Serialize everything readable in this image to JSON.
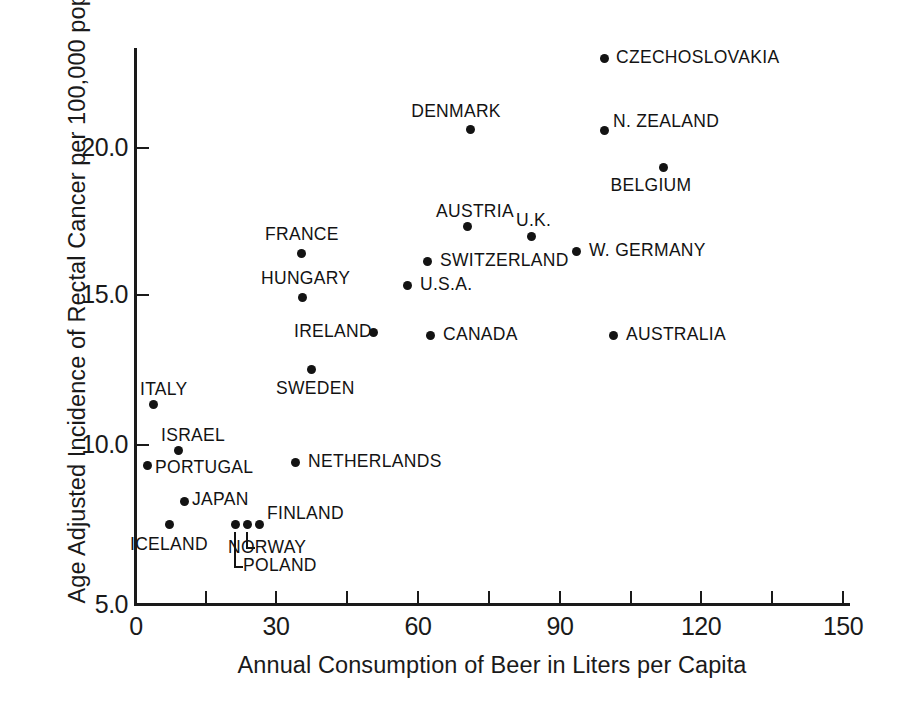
{
  "chart_data": {
    "type": "scatter",
    "title": "",
    "xlabel": "Annual Consumption of Beer in Liters per Capita",
    "ylabel": "Age Adjusted Incidence of Rectal Cancer per 100,000 pop.",
    "xlim": [
      0,
      160
    ],
    "ylim": [
      5.0,
      23.5
    ],
    "grid": false,
    "legend": "none",
    "xticks": [
      0,
      30,
      60,
      90,
      120,
      150
    ],
    "xtick_labels": [
      "0",
      "30",
      "60",
      "90",
      "120",
      "150"
    ],
    "xminor_ticks": [
      15,
      45,
      75,
      105,
      135
    ],
    "yticks": [
      5.0,
      10.0,
      15.0,
      20.0
    ],
    "ytick_labels": [
      "5.0",
      "10.0",
      "15.0",
      "20.0"
    ],
    "point_color": "#131313",
    "axis_color": "#1a1a1a",
    "points": [
      {
        "name": "CZECHOSLOVAKIA",
        "x": 100.5,
        "y": 23.0,
        "px": 604,
        "py": 58,
        "label_x": 616,
        "label_y": 49,
        "anchor": "left"
      },
      {
        "name": "DENMARK",
        "x": 71.8,
        "y": 20.6,
        "px": 470,
        "py": 129,
        "label_x": 456,
        "label_y": 103,
        "anchor": "center"
      },
      {
        "name": "N. ZEALAND",
        "x": 100.5,
        "y": 20.5,
        "px": 604,
        "py": 130,
        "label_x": 613,
        "label_y": 113,
        "anchor": "left"
      },
      {
        "name": "BELGIUM",
        "x": 113.1,
        "y": 19.3,
        "px": 663,
        "py": 167,
        "label_x": 651,
        "label_y": 177,
        "anchor": "center"
      },
      {
        "name": "AUSTRIA",
        "x": 71.1,
        "y": 17.4,
        "px": 467,
        "py": 226,
        "label_x": 436,
        "label_y": 203,
        "anchor": "left"
      },
      {
        "name": "U.K.",
        "x": 84.9,
        "y": 17.0,
        "px": 531,
        "py": 236,
        "label_x": 516,
        "label_y": 212,
        "anchor": "left"
      },
      {
        "name": "SWITZERLAND",
        "x": 62.6,
        "y": 16.3,
        "px": 427,
        "py": 261,
        "label_x": 440,
        "label_y": 252,
        "anchor": "left"
      },
      {
        "name": "W. GERMANY",
        "x": 94.5,
        "y": 16.6,
        "px": 576,
        "py": 251,
        "label_x": 589,
        "label_y": 242,
        "anchor": "left"
      },
      {
        "name": "FRANCE",
        "x": 35.6,
        "y": 16.6,
        "px": 301,
        "py": 253,
        "label_x": 265,
        "label_y": 226,
        "anchor": "left"
      },
      {
        "name": "U.S.A.",
        "x": 58.3,
        "y": 15.5,
        "px": 407,
        "py": 285,
        "label_x": 420,
        "label_y": 276,
        "anchor": "left"
      },
      {
        "name": "HUNGARY",
        "x": 35.8,
        "y": 15.0,
        "px": 302,
        "py": 297,
        "label_x": 261,
        "label_y": 270,
        "anchor": "left"
      },
      {
        "name": "IRELAND",
        "x": 51.0,
        "y": 13.8,
        "px": 373,
        "py": 332,
        "label_x": 294,
        "label_y": 323,
        "anchor": "left"
      },
      {
        "name": "CANADA",
        "x": 63.2,
        "y": 13.7,
        "px": 430,
        "py": 335,
        "label_x": 443,
        "label_y": 326,
        "anchor": "left"
      },
      {
        "name": "AUSTRALIA",
        "x": 102.4,
        "y": 13.7,
        "px": 613,
        "py": 335,
        "label_x": 626,
        "label_y": 326,
        "anchor": "left"
      },
      {
        "name": "SWEDEN",
        "x": 37.7,
        "y": 12.7,
        "px": 311,
        "py": 369,
        "label_x": 276,
        "label_y": 380,
        "anchor": "left"
      },
      {
        "name": "ITALY",
        "x": 3.9,
        "y": 11.4,
        "px": 153,
        "py": 404,
        "label_x": 140,
        "label_y": 381,
        "anchor": "left"
      },
      {
        "name": "ISRAEL",
        "x": 9.2,
        "y": 9.9,
        "px": 178,
        "py": 450,
        "label_x": 161,
        "label_y": 427,
        "anchor": "left"
      },
      {
        "name": "PORTUGAL",
        "x": 2.6,
        "y": 9.3,
        "px": 147,
        "py": 465,
        "label_x": 155,
        "label_y": 459,
        "anchor": "left"
      },
      {
        "name": "NETHERLANDS",
        "x": 34.3,
        "y": 9.4,
        "px": 295,
        "py": 462,
        "label_x": 308,
        "label_y": 453,
        "anchor": "left"
      },
      {
        "name": "JAPAN",
        "x": 10.5,
        "y": 8.1,
        "px": 184,
        "py": 501,
        "label_x": 192,
        "label_y": 491,
        "anchor": "left"
      },
      {
        "name": "ICELAND",
        "x": 7.3,
        "y": 7.4,
        "px": 169,
        "py": 524,
        "label_x": 130,
        "label_y": 536,
        "anchor": "left"
      },
      {
        "name": "POLAND",
        "x": 21.4,
        "y": 7.4,
        "px": 235,
        "py": 524,
        "label_x": 243,
        "label_y": 557,
        "anchor": "left"
      },
      {
        "name": "NORWAY",
        "x": 24.0,
        "y": 7.4,
        "px": 247,
        "py": 524,
        "label_x": 228,
        "label_y": 539,
        "anchor": "left"
      },
      {
        "name": "FINLAND",
        "x": 26.6,
        "y": 7.4,
        "px": 259,
        "py": 524,
        "label_x": 267,
        "label_y": 505,
        "anchor": "left"
      }
    ]
  },
  "axes": {
    "y_title": "Age Adjusted Incidence of Rectal Cancer per 100,000 pop.",
    "x_title": "Annual Consumption of Beer in Liters per Capita",
    "y_labels": [
      "20.0",
      "15.0",
      "10.0",
      "5.0"
    ],
    "x_labels": [
      "0",
      "30",
      "60",
      "90",
      "120",
      "150"
    ]
  },
  "labels": {
    "czechoslovakia": "CZECHOSLOVAKIA",
    "denmark": "DENMARK",
    "n_zealand": "N. ZEALAND",
    "belgium": "BELGIUM",
    "austria": "AUSTRIA",
    "uk": "U.K.",
    "switzerland": "SWITZERLAND",
    "w_germany": "W. GERMANY",
    "france": "FRANCE",
    "usa": "U.S.A.",
    "hungary": "HUNGARY",
    "ireland": "IRELAND",
    "canada": "CANADA",
    "australia": "AUSTRALIA",
    "sweden": "SWEDEN",
    "italy": "ITALY",
    "israel": "ISRAEL",
    "portugal": "PORTUGAL",
    "netherlands": "NETHERLANDS",
    "japan": "JAPAN",
    "iceland": "ICELAND",
    "poland": "POLAND",
    "norway": "NORWAY",
    "finland": "FINLAND"
  }
}
